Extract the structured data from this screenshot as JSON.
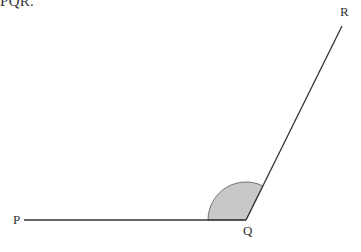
{
  "caption": "PQR.",
  "diagram": {
    "type": "angle",
    "points": {
      "P": {
        "label": "P",
        "x": 24,
        "y": 220
      },
      "Q": {
        "label": "Q",
        "x": 246,
        "y": 220
      },
      "R": {
        "label": "R",
        "x": 342,
        "y": 26
      }
    },
    "label_positions": {
      "P": {
        "x": 13,
        "y": 224
      },
      "Q": {
        "x": 243,
        "y": 235
      },
      "R": {
        "x": 340,
        "y": 16
      }
    },
    "angle_arc": {
      "vertex": "Q",
      "radius": 38,
      "fill": "#c8c8c8",
      "stroke": "#555555"
    },
    "line_color": "#333333"
  }
}
